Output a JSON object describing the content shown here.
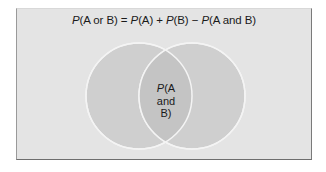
{
  "diagram": {
    "type": "venn",
    "formula": {
      "p1": "P",
      "t1": "(A or B) = ",
      "p2": "P",
      "t2": "(A) + ",
      "p3": "P",
      "t3": "(B) − ",
      "p4": "P",
      "t4": "(A and B)"
    },
    "sets": [
      {
        "name": "A",
        "cx": 138,
        "cy": 95,
        "r": 53
      },
      {
        "name": "B",
        "cx": 191,
        "cy": 95,
        "r": 53
      }
    ],
    "intersection_label": {
      "p": "P",
      "line1": "(A",
      "line2": "and B)"
    },
    "colors": {
      "background": "#e4e4e4",
      "circle_fill": "#cfcfcf",
      "intersection_fill": "#c2c2c2",
      "circle_stroke": "#f4f4f4",
      "text": "#1a1a1a"
    }
  }
}
